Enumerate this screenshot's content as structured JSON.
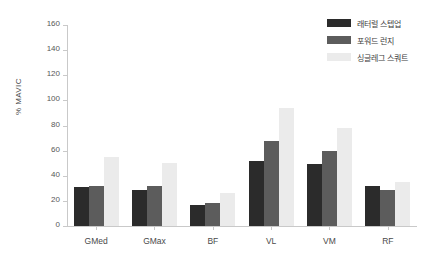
{
  "chart_data": {
    "type": "bar",
    "title": "",
    "subtitle": "",
    "xlabel": "",
    "ylabel": "% MAVIC",
    "ylim": [
      0,
      160
    ],
    "yticks": [
      0,
      20,
      40,
      60,
      80,
      100,
      120,
      140,
      160
    ],
    "grid": false,
    "legend_position": "top-right",
    "categories": [
      "GMed",
      "GMax",
      "BF",
      "VL",
      "VM",
      "RF"
    ],
    "series": [
      {
        "name": "래터럴 스텝업",
        "color": "#2b2b2b",
        "values": [
          31,
          28.5,
          17,
          52,
          49,
          32
        ]
      },
      {
        "name": "포워드 런지",
        "color": "#5c5c5c",
        "values": [
          32,
          32,
          18,
          68,
          60,
          29
        ]
      },
      {
        "name": "싱글레그 스쿼트",
        "color": "#ebebeb",
        "values": [
          55,
          50,
          26,
          94,
          78,
          35
        ]
      }
    ]
  },
  "axis": {
    "y_title": "% MAVIC"
  }
}
